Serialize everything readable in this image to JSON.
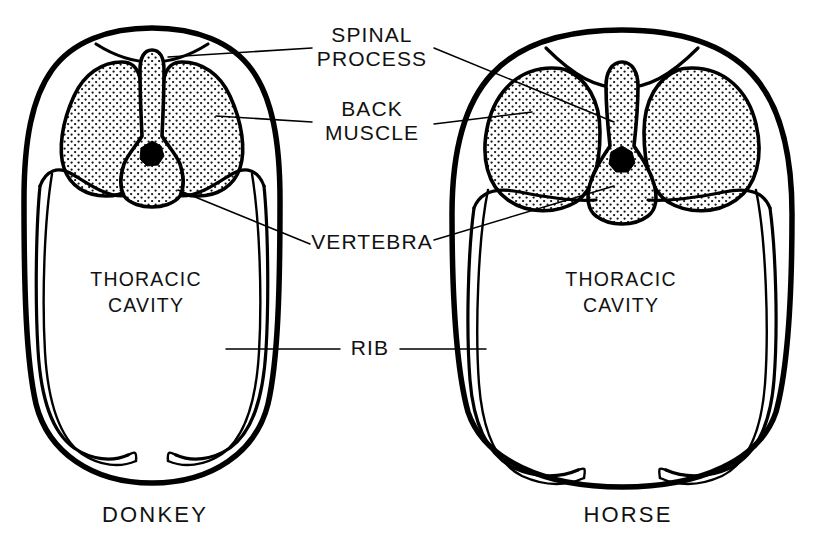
{
  "figure": {
    "kind": "anatomical-cross-section-diagram",
    "background_color": "#ffffff",
    "ink_color": "#000000",
    "width": 815,
    "height": 554
  },
  "labels": {
    "spinal_process": {
      "line1": "SPINAL",
      "line2": "PROCESS",
      "x": 372,
      "y_line1": 42,
      "y_line2": 66
    },
    "back_muscle": {
      "line1": "BACK",
      "line2": "MUSCLE",
      "x": 372,
      "y_line1": 116,
      "y_line2": 140
    },
    "vertebra": {
      "line1": "VERTEBRA",
      "x": 372,
      "y_line1": 249
    },
    "rib": {
      "line1": "RIB",
      "x": 370,
      "y_line1": 355
    }
  },
  "cavity_label": {
    "line1": "THORACIC",
    "line2": "CAVITY"
  },
  "specimens": [
    {
      "id": "donkey",
      "name": "DONKEY",
      "name_x": 155,
      "name_y": 522,
      "cavity_x": 146,
      "cavity_y_line1": 286,
      "cavity_y_line2": 312,
      "torso_shape": "narrow-oval",
      "spinal_process_height": "tall",
      "back_muscle_shape": "tall-oval",
      "back_muscles_count": 2
    },
    {
      "id": "horse",
      "name": "HORSE",
      "name_x": 628,
      "name_y": 522,
      "cavity_x": 621,
      "cavity_y_line1": 286,
      "cavity_y_line2": 312,
      "torso_shape": "wide-barrel",
      "spinal_process_height": "short",
      "back_muscle_shape": "round",
      "back_muscles_count": 2
    }
  ],
  "structures": [
    {
      "key": "spinal_process",
      "label": "SPINAL PROCESS",
      "fill": "stipple"
    },
    {
      "key": "back_muscle",
      "label": "BACK MUSCLE",
      "fill": "stipple"
    },
    {
      "key": "vertebra",
      "label": "VERTEBRA",
      "fill": "stipple"
    },
    {
      "key": "rib",
      "label": "RIB",
      "fill": "outline"
    },
    {
      "key": "thoracic_cavity",
      "label": "THORACIC CAVITY",
      "fill": "white"
    },
    {
      "key": "spinal_canal",
      "label": "spinal canal",
      "fill": "solid-black"
    }
  ]
}
